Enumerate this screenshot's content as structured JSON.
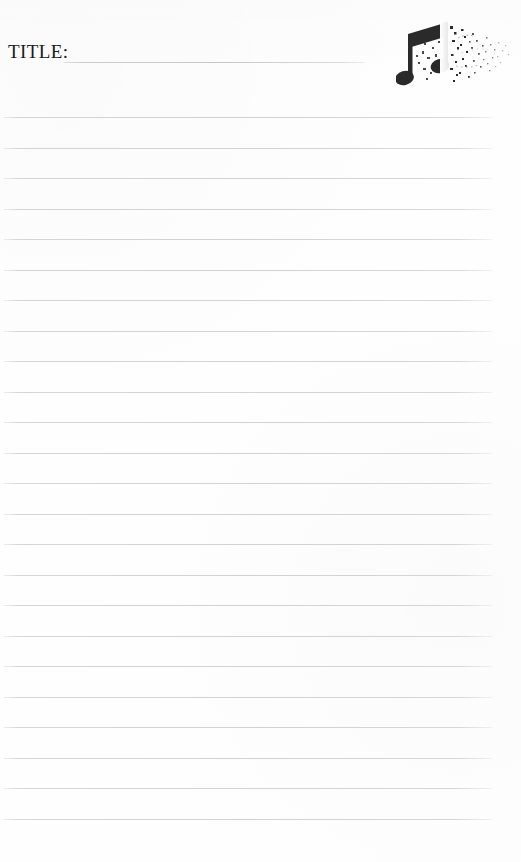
{
  "page": {
    "width": 521,
    "height": 862,
    "background_color": "#fefefe",
    "kind": "lined-song-title-sheet"
  },
  "header": {
    "title_label": "TITLE:",
    "title_value": "",
    "title_placeholder": "",
    "fill_line": {
      "x": 64,
      "y": 62,
      "width": 301,
      "color": "#c9c9c9"
    }
  },
  "artwork": {
    "icon_name": "music-note-icon",
    "description": "beamed eighth note pair with grunge splatter dissolve",
    "color": "#2a2a2a",
    "x": 396,
    "y": 16,
    "width": 118,
    "height": 82
  },
  "ruled_lines": {
    "count": 24,
    "first_y": 117,
    "spacing": 30.5,
    "left": 4,
    "width": 488,
    "color": "#d2d2d2",
    "positions": [
      117,
      147.5,
      178,
      208.5,
      239,
      269.5,
      300,
      330.5,
      361,
      391.5,
      422,
      452.5,
      483,
      513.5,
      544,
      574.5,
      605,
      635.5,
      666,
      696.5,
      727,
      757.5,
      788,
      818.5
    ]
  }
}
